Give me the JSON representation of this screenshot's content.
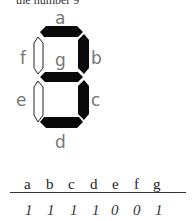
{
  "caption_fragment": "the number 9",
  "segments": {
    "a": {
      "label": "a",
      "state": "on"
    },
    "b": {
      "label": "b",
      "state": "on"
    },
    "c": {
      "label": "c",
      "state": "on"
    },
    "d": {
      "label": "d",
      "state": "on"
    },
    "e": {
      "label": "e",
      "state": "off"
    },
    "f": {
      "label": "f",
      "state": "off"
    },
    "g": {
      "label": "g",
      "state": "on"
    }
  },
  "colors": {
    "on": "#0a0a0a",
    "off_fill": "#ffffff",
    "off_stroke": "#222222",
    "label": "#777777"
  },
  "table": {
    "headers": [
      "a",
      "b",
      "c",
      "d",
      "e",
      "f",
      "g"
    ],
    "values": [
      "1",
      "1",
      "1",
      "1",
      "0",
      "0",
      "1"
    ]
  }
}
